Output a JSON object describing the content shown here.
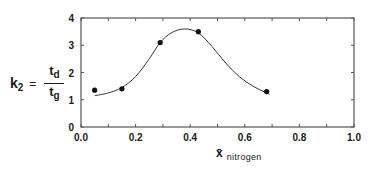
{
  "chart_data": {
    "type": "scatter",
    "title": "",
    "xlabel": "x̄ nitrogen",
    "xlabel_main": "x̄",
    "xlabel_sub": "nitrogen",
    "ylabel": "k2 = td / tg",
    "ylabel_parts": {
      "lhs": "k",
      "lhs_sub": "2",
      "eq": "=",
      "num": "t",
      "num_sub": "d",
      "den": "t",
      "den_sub": "g"
    },
    "xlim": [
      0.0,
      1.0
    ],
    "ylim": [
      0,
      4
    ],
    "x_ticks": [
      "0.0",
      "0.2",
      "0.4",
      "0.6",
      "0.8",
      "1.0"
    ],
    "y_ticks": [
      "0",
      "1",
      "2",
      "3",
      "4"
    ],
    "grid": false,
    "series": [
      {
        "name": "measured",
        "marker": "filled-circle",
        "x": [
          0.05,
          0.15,
          0.29,
          0.43,
          0.68
        ],
        "y": [
          1.35,
          1.4,
          3.1,
          3.5,
          1.3
        ]
      },
      {
        "name": "fitted curve",
        "style": "line",
        "x": [
          0.05,
          0.1,
          0.15,
          0.2,
          0.25,
          0.29,
          0.33,
          0.38,
          0.43,
          0.48,
          0.53,
          0.58,
          0.63,
          0.69
        ],
        "y": [
          1.15,
          1.25,
          1.45,
          1.85,
          2.5,
          3.1,
          3.45,
          3.6,
          3.45,
          2.95,
          2.35,
          1.85,
          1.5,
          1.2
        ]
      }
    ],
    "colors": {
      "axis": "#555555",
      "curve": "#333333",
      "marker": "#111111"
    }
  }
}
